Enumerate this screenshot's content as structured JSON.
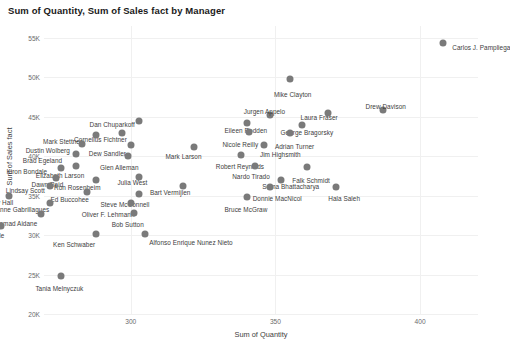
{
  "chart_data": {
    "type": "scatter",
    "title": "Sum of Quantity, Sum of Sales fact by Manager",
    "xlabel": "Sum of Quantity",
    "ylabel": "Sum of Sales fact",
    "xlim": [
      270,
      420
    ],
    "ylim": [
      20000,
      56500
    ],
    "x_ticks": [
      {
        "value": 300,
        "label": "300"
      },
      {
        "value": 350,
        "label": "350"
      },
      {
        "value": 400,
        "label": "400"
      }
    ],
    "y_ticks": [
      {
        "value": 55000,
        "label": "55K"
      },
      {
        "value": 50000,
        "label": "50K"
      },
      {
        "value": 45000,
        "label": "45K"
      },
      {
        "value": 40000,
        "label": "40K"
      },
      {
        "value": 35000,
        "label": "35K"
      },
      {
        "value": 30000,
        "label": "30K"
      },
      {
        "value": 25000,
        "label": "25K"
      },
      {
        "value": 20000,
        "label": "20K"
      }
    ],
    "grid": true,
    "legend": "none",
    "marker_color": "#7a7a7a",
    "series_name": "Manager",
    "points": [
      {
        "label": "Carlos J. Pampliega",
        "x": 408,
        "y": 54300,
        "lx": 9,
        "ly": -1
      },
      {
        "label": "Mike Clayton",
        "x": 355,
        "y": 49800,
        "lx": -16,
        "ly": 10
      },
      {
        "label": "Drew Davison",
        "x": 387,
        "y": 45900,
        "lx": -17,
        "ly": -9
      },
      {
        "label": "Laura Fraser",
        "x": 368,
        "y": 45500,
        "lx": -27,
        "ly": -1
      },
      {
        "label": "Jurgen Appelo",
        "x": 348,
        "y": 45200,
        "lx": -26,
        "ly": -9
      },
      {
        "label": "Eileen Rodden",
        "x": 340,
        "y": 44200,
        "lx": -22,
        "ly": 2
      },
      {
        "label": "George Bragorsky",
        "x": 359,
        "y": 43900,
        "lx": -21,
        "ly": 2
      },
      {
        "label": "Dan Chuparkoff",
        "x": 303,
        "y": 44400,
        "lx": -50,
        "ly": -2
      },
      {
        "label": "Cornelius Fichtner",
        "x": 297,
        "y": 43000,
        "lx": -48,
        "ly": 1
      },
      {
        "label": "Mark Stettner",
        "x": 288,
        "y": 42700,
        "lx": -53,
        "ly": 1
      },
      {
        "label": "Nicole Reilly",
        "x": 341,
        "y": 43100,
        "lx": -27,
        "ly": 7
      },
      {
        "label": "Adrian Turner",
        "x": 355,
        "y": 42900,
        "lx": -15,
        "ly": 8
      },
      {
        "label": "Dustin Wolberg",
        "x": 283,
        "y": 41500,
        "lx": -56,
        "ly": 1
      },
      {
        "label": "Dew Sandler",
        "x": 300,
        "y": 41400,
        "lx": -42,
        "ly": 3
      },
      {
        "label": "Mark Larson",
        "x": 322,
        "y": 41200,
        "lx": -29,
        "ly": 4
      },
      {
        "label": "Jim Highsmith",
        "x": 346,
        "y": 41400,
        "lx": -4,
        "ly": 4
      },
      {
        "label": "Brad Egeland",
        "x": 281,
        "y": 40300,
        "lx": -53,
        "ly": 1
      },
      {
        "label": "Glen Alleman",
        "x": 299,
        "y": 40000,
        "lx": -28,
        "ly": 6
      },
      {
        "label": "Robert Reynolds",
        "x": 338,
        "y": 40200,
        "lx": -25,
        "ly": 6
      },
      {
        "label": "Elizabeth Larson",
        "x": 281,
        "y": 38700,
        "lx": -40,
        "ly": 4
      },
      {
        "label": "Kiron Bondale",
        "x": 276,
        "y": 38500,
        "lx": -55,
        "ly": -2
      },
      {
        "label": "Nardo Tirado",
        "x": 343,
        "y": 38700,
        "lx": -23,
        "ly": 5
      },
      {
        "label": "Falk Schmidt",
        "x": 361,
        "y": 38600,
        "lx": -15,
        "ly": 8
      },
      {
        "label": "Julia West",
        "x": 303,
        "y": 37400,
        "lx": -22,
        "ly": 0
      },
      {
        "label": "Dawn Reid",
        "x": 274,
        "y": 37200,
        "lx": -24,
        "ly": 1
      },
      {
        "label": "Ron Rosenheim",
        "x": 288,
        "y": 37000,
        "lx": -42,
        "ly": 2
      },
      {
        "label": "Soma Bhattacharya",
        "x": 352,
        "y": 37000,
        "lx": -19,
        "ly": 1
      },
      {
        "label": "Lindsay Scott",
        "x": 272,
        "y": 36200,
        "lx": -44,
        "ly": -1
      },
      {
        "label": "Bart Vermijlen",
        "x": 318,
        "y": 36200,
        "lx": -33,
        "ly": 1
      },
      {
        "label": "Donnie MacNicol",
        "x": 348,
        "y": 36100,
        "lx": -17,
        "ly": 6
      },
      {
        "label": "Hala Saleh",
        "x": 371,
        "y": 36100,
        "lx": -8,
        "ly": 6
      },
      {
        "label": "Ed Buccohee",
        "x": 285,
        "y": 35400,
        "lx": -37,
        "ly": 2
      },
      {
        "label": "Steve McConnell",
        "x": 303,
        "y": 35200,
        "lx": -39,
        "ly": 5
      },
      {
        "label": "Harry Hall",
        "x": 258,
        "y": 35000,
        "lx": -25,
        "ly": 1
      },
      {
        "label": "Bruce McGraw",
        "x": 340,
        "y": 34800,
        "lx": -22,
        "ly": 7
      },
      {
        "label": "Anne Gabrillagues",
        "x": 272,
        "y": 34100,
        "lx": -54,
        "ly": 1
      },
      {
        "label": "Oliver F. Lehmann",
        "x": 300,
        "y": 34100,
        "lx": -49,
        "ly": 6
      },
      {
        "label": "Bob Galen",
        "x": 252,
        "y": 33900,
        "lx": -31,
        "ly": 2
      },
      {
        "label": "Samad Aidane",
        "x": 269,
        "y": 32700,
        "lx": -46,
        "ly": 4
      },
      {
        "label": "Bob Sutton",
        "x": 301,
        "y": 32800,
        "lx": -22,
        "ly": 6
      },
      {
        "label": "Deanne Earle",
        "x": 255,
        "y": 31100,
        "lx": -36,
        "ly": 4
      },
      {
        "label": "Ken Schwaber",
        "x": 288,
        "y": 30200,
        "lx": -43,
        "ly": 5
      },
      {
        "label": "Alfonso Enrique Nunez Nieto",
        "x": 305,
        "y": 30200,
        "lx": 4,
        "ly": 3
      },
      {
        "label": "Tania Melnyczuk",
        "x": 276,
        "y": 24800,
        "lx": -26,
        "ly": 7
      }
    ]
  }
}
